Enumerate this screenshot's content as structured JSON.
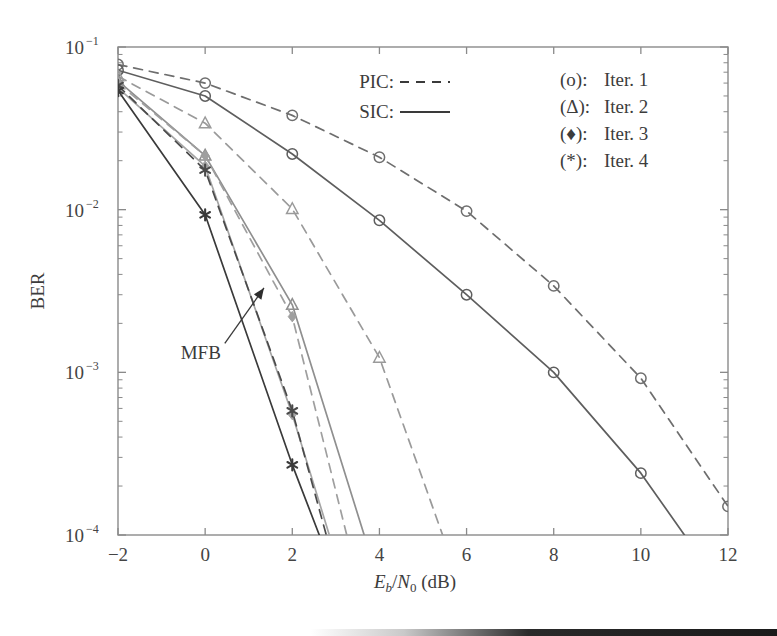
{
  "chart_data": {
    "type": "line",
    "title": "",
    "xlabel": "Eb/N0 (dB)",
    "xlabel_parts": {
      "e": "E",
      "b": "b",
      "slash": "/",
      "n": "N",
      "zero": "0",
      "unit": " (dB)"
    },
    "ylabel": "BER",
    "xlim": [
      -2,
      12
    ],
    "ylim": [
      0.0001,
      0.1
    ],
    "yscale": "log",
    "xticks": [
      -2,
      0,
      2,
      4,
      6,
      8,
      10,
      12
    ],
    "xtick_labels": [
      "−2",
      "0",
      "2",
      "4",
      "6",
      "8",
      "10",
      "12"
    ],
    "yticks": [
      0.1,
      0.01,
      0.001,
      0.0001
    ],
    "ytick_labels": [
      "10−1",
      "10−2",
      "10−3",
      "10−4"
    ],
    "ytick_mantissa": "10",
    "ytick_exponents": [
      "−1",
      "−2",
      "−3",
      "−4"
    ],
    "grid": false,
    "legend_position": "top-right",
    "annotations": [
      {
        "text": "MFB",
        "x": -0.1,
        "y": 0.0012,
        "arrow_to_x": 1.35,
        "arrow_to_y": 0.0033
      }
    ],
    "series": [
      {
        "name": "PIC Iter. 1",
        "detector": "PIC",
        "iteration": 1,
        "linestyle": "dashed",
        "marker": "o",
        "color": "#6e6e6e",
        "x": [
          -2,
          0,
          2,
          4,
          6,
          8,
          10,
          12
        ],
        "y": [
          0.078,
          0.06,
          0.038,
          0.021,
          0.0098,
          0.0034,
          0.00092,
          0.00015
        ]
      },
      {
        "name": "SIC Iter. 1",
        "detector": "SIC",
        "iteration": 1,
        "linestyle": "solid",
        "marker": "o",
        "color": "#5e5e5e",
        "x": [
          -2,
          0,
          2,
          4,
          6,
          8,
          10,
          11
        ],
        "y": [
          0.072,
          0.05,
          0.022,
          0.0086,
          0.003,
          0.001,
          0.00024,
          0.0001
        ]
      },
      {
        "name": "PIC Iter. 2",
        "detector": "PIC",
        "iteration": 2,
        "linestyle": "dashed",
        "marker": "triangle",
        "color": "#9a9a9a",
        "x": [
          -2,
          0,
          2,
          4,
          5.45
        ],
        "y": [
          0.066,
          0.034,
          0.0101,
          0.00123,
          0.0001
        ]
      },
      {
        "name": "SIC Iter. 2",
        "detector": "SIC",
        "iteration": 2,
        "linestyle": "solid",
        "marker": "triangle",
        "color": "#8f8f8f",
        "x": [
          -2,
          0,
          2,
          3.65
        ],
        "y": [
          0.062,
          0.0215,
          0.0026,
          0.0001
        ]
      },
      {
        "name": "PIC Iter. 3",
        "detector": "PIC",
        "iteration": 3,
        "linestyle": "dashed",
        "marker": "diamond",
        "color": "#9f9f9f",
        "x": [
          -2,
          0,
          2,
          3.25
        ],
        "y": [
          0.06,
          0.0215,
          0.0022,
          0.0001
        ]
      },
      {
        "name": "SIC Iter. 3",
        "detector": "SIC",
        "iteration": 3,
        "linestyle": "solid",
        "marker": "diamond",
        "color": "#a5a5a5",
        "x": [
          -2,
          0,
          2,
          2.85
        ],
        "y": [
          0.056,
          0.0185,
          0.00055,
          0.0001
        ]
      },
      {
        "name": "PIC Iter. 4",
        "detector": "PIC",
        "iteration": 4,
        "linestyle": "dashed",
        "marker": "star",
        "color": "#4a4a4a",
        "x": [
          -2,
          0,
          2,
          2.78
        ],
        "y": [
          0.058,
          0.0175,
          0.00058,
          0.0001
        ]
      },
      {
        "name": "SIC Iter. 4",
        "detector": "SIC",
        "iteration": 4,
        "linestyle": "solid",
        "marker": "star",
        "color": "#3a3a3a",
        "x": [
          -2,
          0,
          2,
          2.62
        ],
        "y": [
          0.054,
          0.0093,
          0.00027,
          0.0001
        ]
      }
    ]
  },
  "legend": {
    "style_entries": [
      {
        "label": "PIC:",
        "linestyle": "dashed"
      },
      {
        "label": "SIC:",
        "linestyle": "solid"
      }
    ],
    "marker_entries": [
      {
        "symbol": "(o):",
        "label": "Iter. 1",
        "marker": "o"
      },
      {
        "symbol": "(Δ):",
        "label": "Iter. 2",
        "marker": "triangle"
      },
      {
        "symbol": "(♦):",
        "label": "Iter. 3",
        "marker": "diamond"
      },
      {
        "symbol": "(*):",
        "label": "Iter. 4",
        "marker": "star"
      }
    ]
  },
  "colors": {
    "frame": "#8a8a8a",
    "text": "#3a3a3a",
    "background": "#ffffff"
  }
}
